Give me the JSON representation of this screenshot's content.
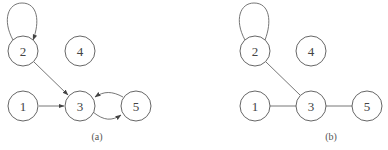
{
  "figures": [
    {
      "caption": "(a)",
      "type": "directed",
      "nodes": [
        {
          "id": "1",
          "label": "1"
        },
        {
          "id": "2",
          "label": "2"
        },
        {
          "id": "3",
          "label": "3"
        },
        {
          "id": "4",
          "label": "4"
        },
        {
          "id": "5",
          "label": "5"
        }
      ],
      "edges": [
        {
          "from": "2",
          "to": "2"
        },
        {
          "from": "2",
          "to": "3"
        },
        {
          "from": "1",
          "to": "3"
        },
        {
          "from": "3",
          "to": "5"
        },
        {
          "from": "5",
          "to": "3"
        }
      ]
    },
    {
      "caption": "(b)",
      "type": "undirected",
      "nodes": [
        {
          "id": "1",
          "label": "1"
        },
        {
          "id": "2",
          "label": "2"
        },
        {
          "id": "3",
          "label": "3"
        },
        {
          "id": "4",
          "label": "4"
        },
        {
          "id": "5",
          "label": "5"
        }
      ],
      "edges": [
        {
          "from": "2",
          "to": "2"
        },
        {
          "from": "2",
          "to": "3"
        },
        {
          "from": "1",
          "to": "3"
        },
        {
          "from": "3",
          "to": "5"
        }
      ]
    }
  ]
}
